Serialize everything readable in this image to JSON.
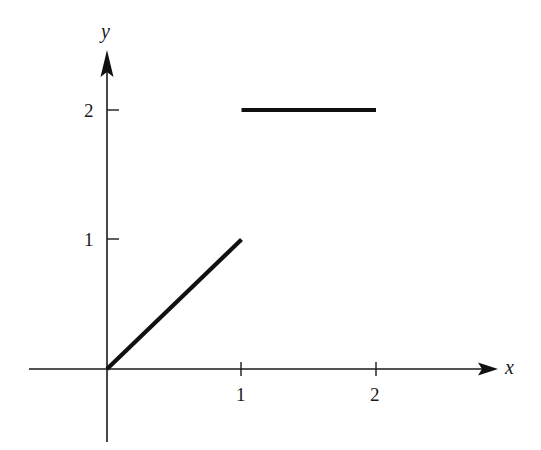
{
  "chart_data": {
    "type": "line",
    "title": "",
    "xlabel": "x",
    "ylabel": "y",
    "xlim": [
      -0.58,
      2.9
    ],
    "ylim": [
      -0.56,
      2.45
    ],
    "x_ticks": [
      1,
      2
    ],
    "x_tick_labels": [
      "1",
      "2"
    ],
    "y_ticks": [
      1,
      2
    ],
    "y_tick_labels": [
      "1",
      "2"
    ],
    "grid": false,
    "legend": null,
    "series": [
      {
        "name": "segment-1",
        "x": [
          0,
          1
        ],
        "y": [
          0,
          1
        ]
      },
      {
        "name": "segment-2",
        "x": [
          1,
          2
        ],
        "y": [
          2,
          2
        ]
      }
    ],
    "colors": {
      "axis": "#1a1a1a",
      "data": "#111111",
      "background": "#ffffff"
    }
  },
  "labels": {
    "x_axis": "x",
    "y_axis": "y",
    "x_tick_1": "1",
    "x_tick_2": "2",
    "y_tick_1": "1",
    "y_tick_2": "2"
  }
}
